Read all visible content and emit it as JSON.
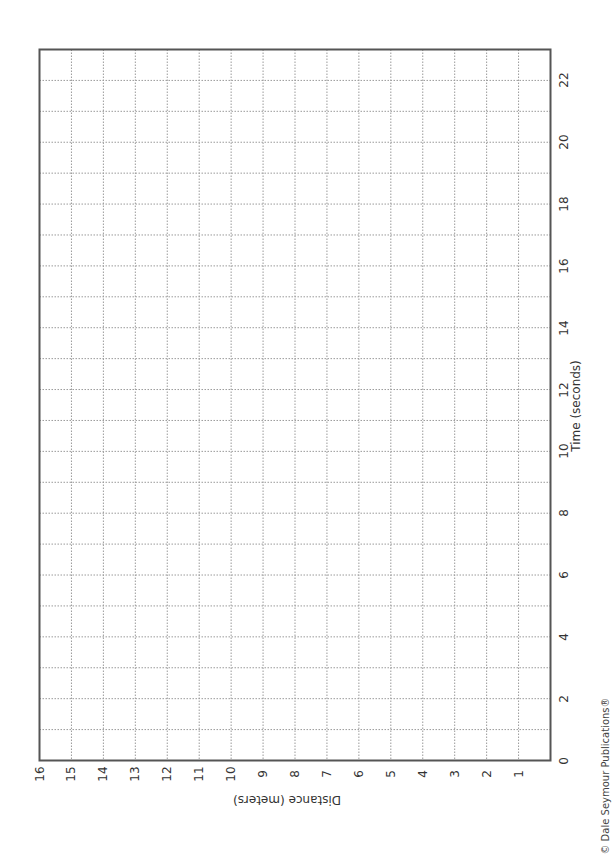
{
  "chart_data": {
    "type": "line",
    "title": "",
    "orientation": "rotated-90-ccw",
    "xlabel": "Time (seconds)",
    "ylabel": "Distance (meters)",
    "xlim": [
      0,
      23
    ],
    "ylim": [
      0,
      16
    ],
    "x_ticks": [
      0,
      2,
      4,
      6,
      8,
      10,
      12,
      14,
      16,
      18,
      20,
      22
    ],
    "y_ticks": [
      1,
      2,
      3,
      4,
      5,
      6,
      7,
      8,
      9,
      10,
      11,
      12,
      13,
      14,
      15,
      16
    ],
    "x_grid_step": 1,
    "y_grid_step": 1,
    "grid": true,
    "grid_style": "dotted",
    "series": []
  },
  "labels": {
    "x_axis_title": "Time (seconds)",
    "y_axis_title": "Distance (meters)",
    "origin": "0",
    "copyright": "© Dale Seymour Publications®"
  },
  "x_tick_labels": [
    "2",
    "4",
    "6",
    "8",
    "10",
    "12",
    "14",
    "16",
    "18",
    "20",
    "22"
  ],
  "y_tick_labels": [
    "1",
    "2",
    "3",
    "4",
    "5",
    "6",
    "7",
    "8",
    "9",
    "10",
    "11",
    "12",
    "13",
    "14",
    "15",
    "16"
  ],
  "colors": {
    "frame": "#555555",
    "grid": "#9a9a9a",
    "text": "#333333"
  }
}
